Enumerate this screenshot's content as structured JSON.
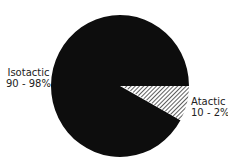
{
  "chart_data": {
    "type": "pie",
    "title": "",
    "categories": [
      "Isotactic",
      "Atactic"
    ],
    "values": [
      92,
      8
    ],
    "value_ranges": {
      "Isotactic": "90 - 98%",
      "Atactic": "10 - 2%"
    },
    "labels": [
      {
        "name": "Isotactic",
        "range": "90 - 98%",
        "fill": "solid",
        "color": "#0d0d0d"
      },
      {
        "name": "Atactic",
        "range": "10 - 2%",
        "fill": "hatched",
        "color": "#ffffff"
      }
    ],
    "legend": "none",
    "annotations": [
      "Isotactic 90 - 98%",
      "Atactic 10 - 2%"
    ]
  },
  "labels": {
    "isotactic": {
      "name": "Isotactic",
      "range": "90 - 98%"
    },
    "atactic": {
      "name": "Atactic",
      "range": "10 - 2%"
    }
  },
  "colors": {
    "solid": "#0d0d0d",
    "hatch_line": "#1a1a1a",
    "hatch_bg": "#ffffff"
  }
}
